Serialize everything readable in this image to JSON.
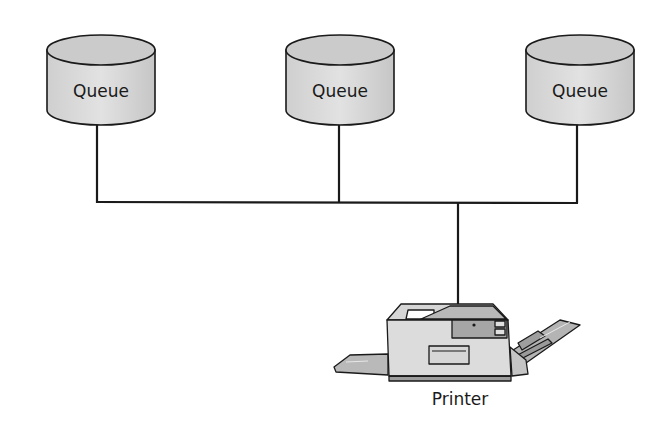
{
  "diagram": {
    "type": "network-topology",
    "queues": [
      {
        "label": "Queue",
        "cx": 101,
        "connector_x": 97
      },
      {
        "label": "Queue",
        "cx": 340,
        "connector_x": 339
      },
      {
        "label": "Queue",
        "cx": 580,
        "connector_x": 577
      }
    ],
    "bus": {
      "y": 202,
      "x_start": 97,
      "x_end": 577
    },
    "printer": {
      "label": "Printer",
      "drop_x": 458
    },
    "colors": {
      "stroke": "#1a1a1a",
      "cylinder_fill": "#d4d4d4",
      "cylinder_top": "#c8c8c8",
      "printer_body": "#dedede",
      "printer_dark": "#a8a8a8",
      "background": "#ffffff"
    }
  }
}
